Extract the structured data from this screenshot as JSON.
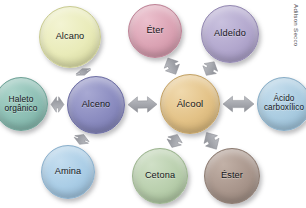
{
  "diagram": {
    "credit": "Adilson Secco",
    "background_color": "#ffffff",
    "arrow_color": "#a6a8ad",
    "arrow_style": "double-headed",
    "hubs": [
      "Alceno",
      "Álcool"
    ],
    "nodes": [
      {
        "id": "alcano",
        "label": "Alcano",
        "cx": 70,
        "cy": 37,
        "r": 31,
        "fill": "#e9ebb9",
        "fill_light": "#f3f4d3",
        "fill_dark": "#c9cb92",
        "font_size": 9.2
      },
      {
        "id": "eter",
        "label": "Éter",
        "cx": 155,
        "cy": 31,
        "r": 27,
        "fill": "#dba3b4",
        "fill_light": "#ebc0cd",
        "fill_dark": "#bd8396",
        "font_size": 9.2
      },
      {
        "id": "aldeido",
        "label": "Aldeído",
        "cx": 230,
        "cy": 34,
        "r": 29,
        "fill": "#b3a8ce",
        "fill_light": "#c9c1de",
        "fill_dark": "#9489b2",
        "font_size": 9.2
      },
      {
        "id": "haleto-organico",
        "label": "Haleto\norgânico",
        "cx": 21,
        "cy": 104,
        "r": 27,
        "fill": "#8dbfb4",
        "fill_light": "#aad3c9",
        "fill_dark": "#6fa297",
        "font_size": 8.4
      },
      {
        "id": "alceno",
        "label": "Alceno",
        "cx": 96,
        "cy": 105,
        "r": 29,
        "fill": "#8b8cc0",
        "fill_light": "#a8a9d3",
        "fill_dark": "#6f70a4",
        "font_size": 9.2
      },
      {
        "id": "alcool",
        "label": "Álcool",
        "cx": 190,
        "cy": 104,
        "r": 30,
        "fill": "#e3c287",
        "fill_light": "#f0d9ad",
        "fill_dark": "#c3a266",
        "font_size": 9.6
      },
      {
        "id": "acido-carboxilico",
        "label": "Ácido\ncarboxílico",
        "cx": 284,
        "cy": 104,
        "r": 27,
        "fill": "#a9cbe0",
        "fill_light": "#c3dcec",
        "fill_dark": "#88adc6",
        "font_size": 8.2
      },
      {
        "id": "amina",
        "label": "Amina",
        "cx": 68,
        "cy": 172,
        "r": 27,
        "fill": "#aacde6",
        "fill_light": "#c4ddef",
        "fill_dark": "#8aafcb",
        "font_size": 9.2
      },
      {
        "id": "cetona",
        "label": "Cetona",
        "cx": 160,
        "cy": 176,
        "r": 28,
        "fill": "#b9cfad",
        "fill_light": "#d0e0c7",
        "fill_dark": "#9ab38d",
        "font_size": 9.2
      },
      {
        "id": "ester",
        "label": "Éster",
        "cx": 232,
        "cy": 176,
        "r": 28,
        "fill": "#a9968c",
        "fill_light": "#c2b1a7",
        "fill_dark": "#8b7a70",
        "font_size": 9.2
      }
    ],
    "connections": [
      {
        "from": "alceno",
        "to": "alcano",
        "label": "Alceno ↔ Alcano"
      },
      {
        "from": "alceno",
        "to": "haleto-organico",
        "label": "Alceno ↔ Haleto orgânico"
      },
      {
        "from": "alceno",
        "to": "amina",
        "label": "Alceno ↔ Amina"
      },
      {
        "from": "alceno",
        "to": "alcool",
        "label": "Alceno ↔ Álcool"
      },
      {
        "from": "alcool",
        "to": "eter",
        "label": "Álcool ↔ Éter"
      },
      {
        "from": "alcool",
        "to": "aldeido",
        "label": "Álcool ↔ Aldeído"
      },
      {
        "from": "alcool",
        "to": "acido-carboxilico",
        "label": "Álcool ↔ Ácido carboxílico"
      },
      {
        "from": "alcool",
        "to": "cetona",
        "label": "Álcool ↔ Cetona"
      },
      {
        "from": "alcool",
        "to": "ester",
        "label": "Álcool ↔ Éster"
      }
    ]
  }
}
